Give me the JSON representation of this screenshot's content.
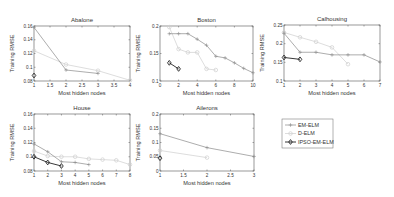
{
  "figure": {
    "legend": {
      "entries": [
        {
          "label": "EM-ELM",
          "color": "#8a8a8a",
          "marker": "plus"
        },
        {
          "label": "D-ELM",
          "color": "#cfcfcf",
          "marker": "circle"
        },
        {
          "label": "IPSO-EM-ELM",
          "color": "#222222",
          "marker": "diamond"
        }
      ]
    }
  },
  "chart_data": [
    {
      "type": "line",
      "title": "Abalone",
      "xlabel": "Most hidden nodes",
      "ylabel": "Training RMSE",
      "xlim": [
        1,
        4
      ],
      "ylim": [
        0.08,
        0.16
      ],
      "xticks": [
        1,
        1.5,
        2,
        2.5,
        3,
        3.5,
        4
      ],
      "xtick_labels": [
        "1",
        "1.5",
        "2",
        "2.5",
        "3",
        "3.5",
        "4"
      ],
      "yticks": [
        0.08,
        0.1,
        0.12,
        0.14,
        0.16
      ],
      "ytick_labels": [
        "0.08",
        "0.1",
        "0.12",
        "0.14",
        "0.16"
      ],
      "grid": false,
      "series": [
        {
          "name": "EM-ELM",
          "x": [
            1,
            2,
            3
          ],
          "y": [
            0.158,
            0.096,
            0.091
          ]
        },
        {
          "name": "D-ELM",
          "x": [
            1,
            2,
            3,
            4
          ],
          "y": [
            0.124,
            0.104,
            0.095,
            0.081
          ]
        },
        {
          "name": "IPSO-EM-ELM",
          "x": [
            1
          ],
          "y": [
            0.088
          ]
        }
      ]
    },
    {
      "type": "line",
      "title": "Boston",
      "xlabel": "Most hidden nodes",
      "ylabel": "Training RMSE",
      "xlim": [
        0,
        10
      ],
      "ylim": [
        0.1,
        0.2
      ],
      "xticks": [
        0,
        2,
        4,
        6,
        8,
        10
      ],
      "xtick_labels": [
        "0",
        "2",
        "4",
        "6",
        "8",
        "10"
      ],
      "yticks": [
        0.1,
        0.15,
        0.2
      ],
      "ytick_labels": [
        "0.1",
        "0.15",
        "0.2"
      ],
      "grid": false,
      "series": [
        {
          "name": "EM-ELM",
          "x": [
            1,
            2,
            3,
            4,
            5,
            6,
            7,
            8,
            9,
            10
          ],
          "y": [
            0.186,
            0.186,
            0.186,
            0.176,
            0.165,
            0.145,
            0.142,
            0.133,
            0.123,
            0.115
          ]
        },
        {
          "name": "D-ELM",
          "x": [
            1,
            2,
            3,
            4,
            5,
            6
          ],
          "y": [
            0.198,
            0.158,
            0.152,
            0.152,
            0.122,
            0.12
          ]
        },
        {
          "name": "IPSO-EM-ELM",
          "x": [
            1,
            2
          ],
          "y": [
            0.133,
            0.122
          ]
        }
      ]
    },
    {
      "type": "line",
      "title": "Calhousing",
      "xlabel": "Most hidden nodes",
      "ylabel": "Training RMSE",
      "xlim": [
        1,
        7
      ],
      "ylim": [
        0.1,
        0.25
      ],
      "xticks": [
        1,
        2,
        3,
        4,
        5,
        6,
        7
      ],
      "xtick_labels": [
        "1",
        "2",
        "3",
        "4",
        "5",
        "6",
        "7"
      ],
      "yticks": [
        0.1,
        0.15,
        0.2,
        0.25
      ],
      "ytick_labels": [
        "0.1",
        "0.15",
        "0.2",
        "0.25"
      ],
      "grid": false,
      "series": [
        {
          "name": "EM-ELM",
          "x": [
            1,
            2,
            3,
            4,
            5,
            6,
            7
          ],
          "y": [
            0.228,
            0.177,
            0.177,
            0.17,
            0.17,
            0.17,
            0.151
          ]
        },
        {
          "name": "D-ELM",
          "x": [
            1,
            2,
            3,
            4,
            5
          ],
          "y": [
            0.23,
            0.217,
            0.205,
            0.19,
            0.145
          ]
        },
        {
          "name": "IPSO-EM-ELM",
          "x": [
            1,
            2
          ],
          "y": [
            0.163,
            0.158
          ]
        }
      ]
    },
    {
      "type": "line",
      "title": "House",
      "xlabel": "Most hidden nodes",
      "ylabel": "Training RMSE",
      "xlim": [
        1,
        8
      ],
      "ylim": [
        0.08,
        0.16
      ],
      "xticks": [
        1,
        2,
        3,
        4,
        5,
        6,
        7,
        8
      ],
      "xtick_labels": [
        "1",
        "2",
        "3",
        "4",
        "5",
        "6",
        "7",
        "8"
      ],
      "yticks": [
        0.08,
        0.1,
        0.12,
        0.14,
        0.16
      ],
      "ytick_labels": [
        "0.08",
        "0.1",
        "0.12",
        "0.14",
        "0.16"
      ],
      "grid": false,
      "series": [
        {
          "name": "EM-ELM",
          "x": [
            1,
            2,
            3,
            4,
            5
          ],
          "y": [
            0.118,
            0.107,
            0.093,
            0.092,
            0.089
          ]
        },
        {
          "name": "D-ELM",
          "x": [
            1,
            2,
            3,
            4,
            5,
            6,
            7,
            8
          ],
          "y": [
            0.108,
            0.101,
            0.1,
            0.1,
            0.097,
            0.096,
            0.095,
            0.089
          ]
        },
        {
          "name": "IPSO-EM-ELM",
          "x": [
            1,
            2,
            3
          ],
          "y": [
            0.1,
            0.092,
            0.087
          ]
        }
      ]
    },
    {
      "type": "line",
      "title": "Ailerons",
      "xlabel": "Most hidden nodes",
      "ylabel": "Training RMSE",
      "xlim": [
        1,
        3
      ],
      "ylim": [
        0,
        0.2
      ],
      "xticks": [
        1,
        1.5,
        2,
        2.5,
        3
      ],
      "xtick_labels": [
        "1",
        "1.5",
        "2",
        "2.5",
        "3"
      ],
      "yticks": [
        0,
        0.05,
        0.1,
        0.15,
        0.2
      ],
      "ytick_labels": [
        "0",
        "0.05",
        "0.1",
        "0.15",
        "0.2"
      ],
      "grid": false,
      "series": [
        {
          "name": "EM-ELM",
          "x": [
            1,
            2,
            3
          ],
          "y": [
            0.131,
            0.082,
            0.051
          ]
        },
        {
          "name": "D-ELM",
          "x": [
            1,
            2
          ],
          "y": [
            0.072,
            0.047
          ]
        },
        {
          "name": "IPSO-EM-ELM",
          "x": [
            1
          ],
          "y": [
            0.045
          ]
        }
      ]
    }
  ]
}
